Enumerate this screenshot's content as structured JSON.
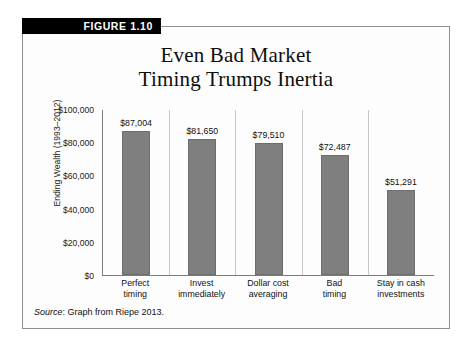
{
  "figure": {
    "tab_label": "FIGURE 1.10",
    "title_line1": "Even Bad Market",
    "title_line2": "Timing Trumps Inertia",
    "source_word": "Source",
    "source_text": ": Graph from Riepe 2013."
  },
  "colors": {
    "bar_fill": "#7f7f7f",
    "tab_background": "#000000",
    "tab_text": "#ffffff",
    "axis_line": "#7d7d7d",
    "separator_line": "#c8c8c8"
  },
  "chart_data": {
    "type": "bar",
    "title": "Even Bad Market Timing Trumps Inertia",
    "xlabel": "",
    "ylabel": "Ending Wealth (1993–2012)",
    "categories": [
      "Perfect timing",
      "Invest immediately",
      "Dollar cost averaging",
      "Bad timing",
      "Stay in cash investments"
    ],
    "category_lines": [
      [
        "Perfect",
        "timing"
      ],
      [
        "Invest",
        "immediately"
      ],
      [
        "Dollar cost",
        "averaging"
      ],
      [
        "Bad",
        "timing"
      ],
      [
        "Stay in cash",
        "investments"
      ]
    ],
    "values": [
      87004,
      81650,
      79510,
      72487,
      51291
    ],
    "value_labels": [
      "$87,004",
      "$81,650",
      "$79,510",
      "$72,487",
      "$51,291"
    ],
    "ylim": [
      0,
      100000
    ],
    "ytick_values": [
      0,
      20000,
      40000,
      60000,
      80000,
      100000
    ],
    "ytick_labels": [
      "$0",
      "$20,000",
      "$40,000",
      "$60,000",
      "$80,000",
      "$100,000"
    ],
    "grid": false,
    "legend": "none",
    "series_name": "Ending Wealth"
  }
}
